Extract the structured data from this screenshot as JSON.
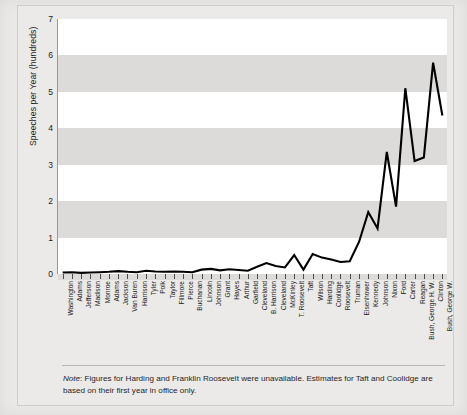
{
  "chart_data": {
    "type": "line",
    "title": "",
    "xlabel": "",
    "ylabel": "Speeches per Year (hundreds)",
    "ylim": [
      0,
      7
    ],
    "yticks": [
      0,
      1,
      2,
      3,
      4,
      5,
      6,
      7
    ],
    "grid": "alternating horizontal bands",
    "legend": "none",
    "categories": [
      "Washington",
      "Adams",
      "Jefferson",
      "Madison",
      "Monroe",
      "Adams",
      "Jackson",
      "Van Buren",
      "Harrison",
      "Tyler",
      "Polk",
      "Taylor",
      "Fillmore",
      "Pierce",
      "Buchanan",
      "Lincoln",
      "Johnson",
      "Grant",
      "Hayes",
      "Arthur",
      "Garfield",
      "Cleveland",
      "B. Harrison",
      "Cleveland",
      "McKinley",
      "T. Roosevelt",
      "Taft",
      "Wilson",
      "Harding",
      "Coolidge",
      "Roosevelt",
      "Truman",
      "Eisenhower",
      "Kennedy",
      "Johnson",
      "Nixon",
      "Ford",
      "Carter",
      "Reagan",
      "Bush, George H. W.",
      "Clinton",
      "Bush, George W."
    ],
    "values": [
      0.04,
      0.05,
      0.03,
      0.04,
      0.05,
      0.06,
      0.08,
      0.06,
      0.05,
      0.09,
      0.07,
      0.06,
      0.07,
      0.06,
      0.05,
      0.12,
      0.14,
      0.1,
      0.13,
      0.11,
      0.09,
      0.2,
      0.3,
      0.22,
      0.18,
      0.52,
      0.12,
      0.55,
      0.45,
      0.4,
      0.33,
      0.35,
      0.88,
      1.7,
      1.25,
      3.35,
      1.85,
      5.1,
      3.1,
      3.2,
      5.8,
      4.35
    ],
    "note_prefix": "Note",
    "note_text": ": Figures for Harding and Franklin Roosevelt were unavailable. Estimates for Taft and Coolidge are based on their first year in office only.",
    "line_color": "#000000",
    "plot_background": "#ffffff",
    "band_color": "#dcdbd9",
    "page_background": "#e9e8e6"
  }
}
